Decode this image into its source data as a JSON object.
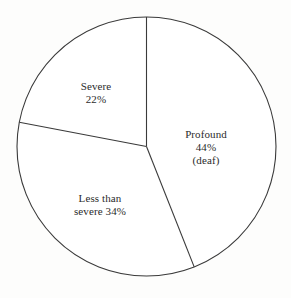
{
  "chart_data": {
    "type": "pie",
    "title": "",
    "subtitle": "",
    "xlabel": "",
    "ylabel": "",
    "legend_position": "none",
    "grid": false,
    "start_angle_deg": 0,
    "direction": "clockwise",
    "units": "percent",
    "categories": [
      "Profound (deaf)",
      "Less than severe",
      "Severe"
    ],
    "values": [
      44,
      34,
      22
    ],
    "slices": [
      {
        "name": "Profound",
        "value": 44,
        "value_label": "44%",
        "note": "(deaf)",
        "label_lines": [
          "Profound",
          "44%",
          "(deaf)"
        ],
        "start_angle_deg": 0,
        "end_angle_deg": 158.4,
        "color": "#ffffff",
        "stroke": "#3a3a3a"
      },
      {
        "name": "Less than severe",
        "value": 34,
        "value_label": "34%",
        "note": "",
        "label_lines": [
          "Less than",
          "severe 34%"
        ],
        "start_angle_deg": 158.4,
        "end_angle_deg": 280.8,
        "color": "#ffffff",
        "stroke": "#3a3a3a"
      },
      {
        "name": "Severe",
        "value": 22,
        "value_label": "22%",
        "note": "",
        "label_lines": [
          "Severe",
          "22%"
        ],
        "start_angle_deg": 280.8,
        "end_angle_deg": 360,
        "color": "#ffffff",
        "stroke": "#3a3a3a"
      }
    ],
    "colors": {
      "background": "#fdfdfc",
      "outline": "#3a3a3a",
      "text": "#2b2b2b"
    }
  },
  "labels": {
    "profound": {
      "line1": "Profound",
      "line2": "44%",
      "line3": "(deaf)"
    },
    "severe": {
      "line1": "Severe",
      "line2": "22%"
    },
    "less_than_severe": {
      "line1": "Less than",
      "line2": "severe 34%"
    }
  }
}
